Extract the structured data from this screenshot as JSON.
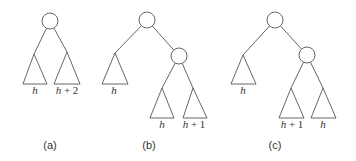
{
  "figure": {
    "panels": [
      {
        "caption": "(a)",
        "root": {
          "cx": 50,
          "cy": 21
        },
        "subtrees": [
          {
            "label": "h",
            "apex": [
              34,
              54
            ],
            "left": [
              23,
              84
            ],
            "right": [
              47,
              84
            ],
            "label_pos": [
              35,
              94
            ]
          },
          {
            "label": "h + 2",
            "apex": [
              67,
              52
            ],
            "left": [
              54,
              84
            ],
            "right": [
              80,
              84
            ],
            "label_pos": [
              67,
              94
            ]
          }
        ],
        "caption_pos": [
          50,
          149
        ]
      },
      {
        "caption": "(b)",
        "root": {
          "cx": 147,
          "cy": 20
        },
        "child": {
          "cx": 179,
          "cy": 56
        },
        "subtrees": [
          {
            "label": "h",
            "apex": [
              115,
              53
            ],
            "left": [
              102,
              84
            ],
            "right": [
              128,
              84
            ],
            "label_pos": [
              114,
              94
            ]
          },
          {
            "label": "h",
            "apex": [
              162,
              88
            ],
            "left": [
              150,
              118
            ],
            "right": [
              174,
              118
            ],
            "label_pos": [
              162,
              128
            ]
          },
          {
            "label": "h + 1",
            "apex": [
              193,
              88
            ],
            "left": [
              183,
              118
            ],
            "right": [
              207,
              118
            ],
            "label_pos": [
              194,
              128
            ]
          }
        ],
        "caption_pos": [
          149,
          149
        ]
      },
      {
        "caption": "(c)",
        "root": {
          "cx": 275,
          "cy": 20
        },
        "child": {
          "cx": 307,
          "cy": 55
        },
        "subtrees": [
          {
            "label": "h",
            "apex": [
              243,
              55
            ],
            "left": [
              231,
              84
            ],
            "right": [
              256,
              84
            ],
            "label_pos": [
              243,
              94
            ]
          },
          {
            "label": "h + 1",
            "apex": [
              291,
              88
            ],
            "left": [
              279,
              118
            ],
            "right": [
              304,
              118
            ],
            "label_pos": [
              292,
              128
            ]
          },
          {
            "label": "h",
            "apex": [
              323,
              88
            ],
            "left": [
              311,
              118
            ],
            "right": [
              336,
              118
            ],
            "label_pos": [
              323,
              128
            ]
          }
        ],
        "caption_pos": [
          275,
          149
        ]
      }
    ],
    "node_radius": 8,
    "colors": {
      "stroke": "#555555",
      "text": "#333333",
      "background": "#ffffff"
    }
  }
}
